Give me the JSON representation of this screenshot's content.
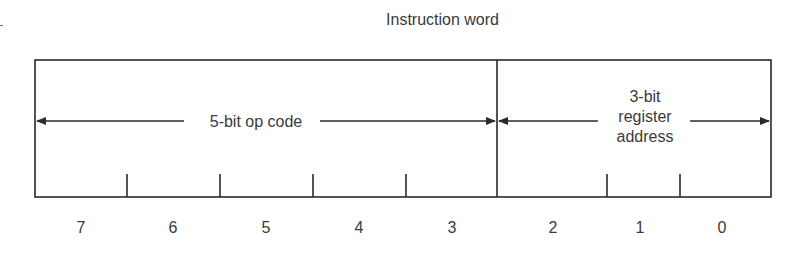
{
  "diagram": {
    "title": "Instruction word",
    "fields": [
      {
        "name": "opcode",
        "label": "5-bit op code",
        "bits": [
          7,
          6,
          5,
          4,
          3
        ]
      },
      {
        "name": "register",
        "label_lines": [
          "3-bit",
          "register",
          "address"
        ],
        "bits": [
          2,
          1,
          0
        ]
      }
    ],
    "bit_labels": [
      "7",
      "6",
      "5",
      "4",
      "3",
      "2",
      "1",
      "0"
    ],
    "colors": {
      "line": "#2a2a2a",
      "text": "#3a3a3a",
      "background": "#ffffff"
    }
  }
}
